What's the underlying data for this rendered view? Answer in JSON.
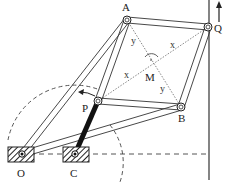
{
  "diagram": {
    "labels": {
      "A": "A",
      "Q": "Q",
      "M": "M",
      "P": "P",
      "B": "B",
      "O": "O",
      "C": "C",
      "x_upper": "x",
      "x_lower": "x",
      "y_upper": "y",
      "y_lower": "y"
    },
    "points": {
      "A": [
        127,
        20
      ],
      "Q": [
        208,
        27
      ],
      "P": [
        98,
        101
      ],
      "B": [
        181,
        107
      ],
      "O": [
        22,
        154
      ],
      "C": [
        75,
        154
      ],
      "M": [
        150,
        64
      ]
    },
    "colors": {
      "line": "#333333",
      "thick_link": "#111111",
      "dashed": "#555555"
    }
  }
}
